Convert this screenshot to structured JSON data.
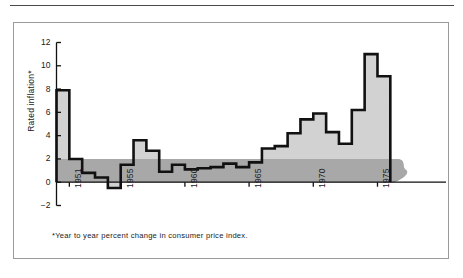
{
  "figure": {
    "footnote": "*Year to year percent change in consumer price index.",
    "frame_color": "#9a9a9a",
    "rule_color": "#4a4a4a"
  },
  "chart_data": {
    "type": "area",
    "title": "",
    "subtitle": "",
    "xlabel": "",
    "ylabel": "Rated inflation*",
    "ylim": [
      -2,
      12
    ],
    "xlim": [
      1950,
      1978
    ],
    "grid": false,
    "legend": null,
    "y_ticks": [
      -2,
      0,
      2,
      4,
      6,
      8,
      10,
      12
    ],
    "y_tick_labels": [
      "−2",
      "0",
      "2",
      "4",
      "6",
      "8",
      "10",
      "12"
    ],
    "x_ticks": [
      1951,
      1955,
      1960,
      1965,
      1970,
      1975
    ],
    "x_tick_labels": [
      "1951",
      "1955",
      "1960",
      "1965",
      "1970",
      "1975"
    ],
    "x": [
      1950,
      1951,
      1952,
      1953,
      1954,
      1955,
      1956,
      1957,
      1958,
      1959,
      1960,
      1961,
      1962,
      1963,
      1964,
      1965,
      1966,
      1967,
      1968,
      1969,
      1970,
      1971,
      1972,
      1973,
      1974,
      1975
    ],
    "values": [
      7.9,
      2.0,
      0.8,
      0.4,
      -0.5,
      1.5,
      3.6,
      2.7,
      0.9,
      1.5,
      1.1,
      1.2,
      1.3,
      1.6,
      1.3,
      1.7,
      2.9,
      3.1,
      4.2,
      5.4,
      5.9,
      4.3,
      3.3,
      6.2,
      11.0,
      9.1
    ],
    "series_name": "Rated inflation",
    "fill_color": "#d2d2d2",
    "line_color": "#111111",
    "band": {
      "label": "reference band",
      "y_low": 0,
      "y_high": 2.0,
      "color": "#a8a8a8",
      "extends_past_axis": true
    },
    "axis_color": "#111111"
  }
}
